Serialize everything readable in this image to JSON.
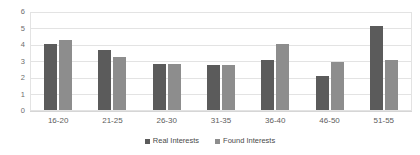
{
  "chart_data": {
    "type": "bar",
    "title": "",
    "subtitle": "",
    "xlabel": "",
    "ylabel": "",
    "categories": [
      "16-20",
      "21-25",
      "26-30",
      "31-35",
      "36-40",
      "46-50",
      "51-55"
    ],
    "series": [
      {
        "name": "Real Interests",
        "color": "#5b5b5b",
        "values": [
          4.1,
          3.7,
          2.85,
          2.8,
          3.1,
          2.1,
          5.2
        ]
      },
      {
        "name": "Found Interests",
        "color": "#8d8d8d",
        "values": [
          4.35,
          3.25,
          2.85,
          2.8,
          4.1,
          3.0,
          3.1
        ]
      }
    ],
    "ylim": [
      0,
      6
    ],
    "y_ticks": [
      "0",
      "1",
      "2",
      "3",
      "4",
      "5",
      "6"
    ],
    "grid": true,
    "legend_position": "bottom"
  }
}
